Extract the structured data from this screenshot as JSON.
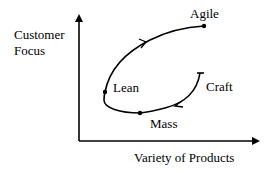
{
  "axes": {
    "y_label_line1": "Customer",
    "y_label_line2": "Focus",
    "x_label": "Variety of Products"
  },
  "stages": {
    "craft": "Craft",
    "mass": "Mass",
    "lean": "Lean",
    "agile": "Agile"
  },
  "path_order": [
    "Craft",
    "Mass",
    "Lean",
    "Agile"
  ],
  "colors": {
    "line": "#000000",
    "background": "#ffffff"
  }
}
